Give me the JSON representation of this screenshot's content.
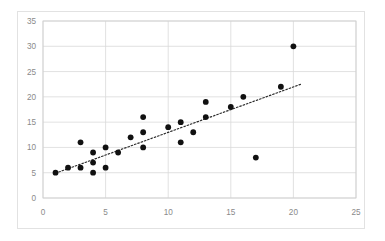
{
  "chart_data": {
    "type": "scatter",
    "title": "",
    "xlabel": "",
    "ylabel": "",
    "xlim": [
      0,
      25
    ],
    "ylim": [
      0,
      35
    ],
    "xticks": [
      0,
      5,
      10,
      15,
      20,
      25
    ],
    "yticks": [
      0,
      5,
      10,
      15,
      20,
      25,
      30,
      35
    ],
    "xtick_labels": [
      "0",
      "5",
      "10",
      "15",
      "20",
      "25"
    ],
    "ytick_labels": [
      "0",
      "5",
      "10",
      "15",
      "20",
      "25",
      "30",
      "35"
    ],
    "grid": true,
    "legend": null,
    "series": [
      {
        "name": "data",
        "marker": "circle",
        "color": "#111111",
        "points": [
          {
            "x": 1,
            "y": 5
          },
          {
            "x": 2,
            "y": 6
          },
          {
            "x": 3,
            "y": 11
          },
          {
            "x": 3,
            "y": 6
          },
          {
            "x": 4,
            "y": 9
          },
          {
            "x": 4,
            "y": 7
          },
          {
            "x": 4,
            "y": 5
          },
          {
            "x": 5,
            "y": 10
          },
          {
            "x": 5,
            "y": 6
          },
          {
            "x": 6,
            "y": 9
          },
          {
            "x": 7,
            "y": 12
          },
          {
            "x": 8,
            "y": 16
          },
          {
            "x": 8,
            "y": 13
          },
          {
            "x": 8,
            "y": 10
          },
          {
            "x": 10,
            "y": 14
          },
          {
            "x": 11,
            "y": 15
          },
          {
            "x": 11,
            "y": 11
          },
          {
            "x": 12,
            "y": 13
          },
          {
            "x": 13,
            "y": 19
          },
          {
            "x": 13,
            "y": 16
          },
          {
            "x": 15,
            "y": 18
          },
          {
            "x": 16,
            "y": 20
          },
          {
            "x": 17,
            "y": 8
          },
          {
            "x": 19,
            "y": 22
          },
          {
            "x": 20,
            "y": 30
          }
        ]
      }
    ],
    "trendline": {
      "style": "dotted",
      "color": "#2b2b2b",
      "x_start": 1.0,
      "y_start": 4.9,
      "x_end": 20.6,
      "y_end": 22.5
    },
    "colors": {
      "background": "#ffffff",
      "grid": "#d9d9d9",
      "axis": "#bfbfbf",
      "tick_text": "#8a8a8a",
      "marker": "#111111",
      "frame_border": "#e2e2e2"
    }
  }
}
